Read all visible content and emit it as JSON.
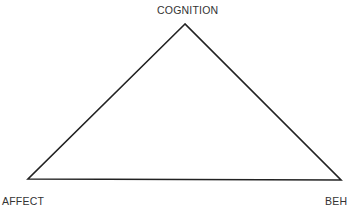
{
  "diagram": {
    "type": "triangle",
    "stroke_color": "#222222",
    "vertices": {
      "top": {
        "label": "COGNITION",
        "x": 185,
        "y": 24
      },
      "left": {
        "label": "AFFECT",
        "x": 28,
        "y": 179
      },
      "right": {
        "label": "BEH",
        "x": 341,
        "y": 180
      }
    }
  }
}
